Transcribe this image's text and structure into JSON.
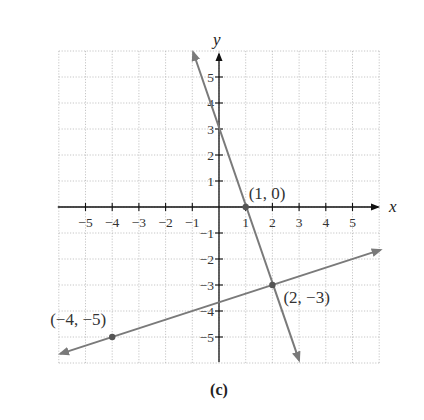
{
  "chart_data": {
    "type": "line",
    "title": "",
    "caption": "(c)",
    "xlabel": "x",
    "ylabel": "y",
    "xlim": [
      -6,
      6
    ],
    "ylim": [
      -6,
      6
    ],
    "grid": true,
    "grid_style": "dotted",
    "x_ticks": [
      -5,
      -4,
      -3,
      -2,
      -1,
      1,
      2,
      3,
      4,
      5
    ],
    "y_ticks": [
      -5,
      -4,
      -3,
      -2,
      -1,
      1,
      2,
      3,
      4,
      5
    ],
    "x_tick_labels": [
      "−5",
      "−4",
      "−3",
      "−2",
      "−1",
      "1",
      "2",
      "3",
      "4",
      "5"
    ],
    "y_tick_labels": [
      "−5",
      "−4",
      "−3",
      "−2",
      "−1",
      "1",
      "2",
      "3",
      "4",
      "5"
    ],
    "series": [
      {
        "name": "line-1",
        "equation": "y = -3x + 3",
        "color": "#7a7a7a",
        "arrows": "both",
        "x": [
          -0.97,
          3.0
        ],
        "y": [
          5.96,
          -5.9
        ]
      },
      {
        "name": "line-2",
        "equation": "y = x/3 - 11/3",
        "color": "#7a7a7a",
        "arrows": "both",
        "x": [
          -5.95,
          6.05
        ],
        "y": [
          -5.65,
          -1.65
        ]
      }
    ],
    "points": [
      {
        "x": 1,
        "y": 0,
        "label": "(1, 0)"
      },
      {
        "x": 2,
        "y": -3,
        "label": "(2, −3)"
      },
      {
        "x": -4,
        "y": -5,
        "label": "(−4, −5)"
      }
    ]
  },
  "layout": {
    "origin_px": [
      219,
      207
    ],
    "unit_x_px": 26.7,
    "unit_y_px": 26.0,
    "axis_color": "#111111",
    "line_color": "#7a7a7a",
    "point_color": "#555555"
  }
}
